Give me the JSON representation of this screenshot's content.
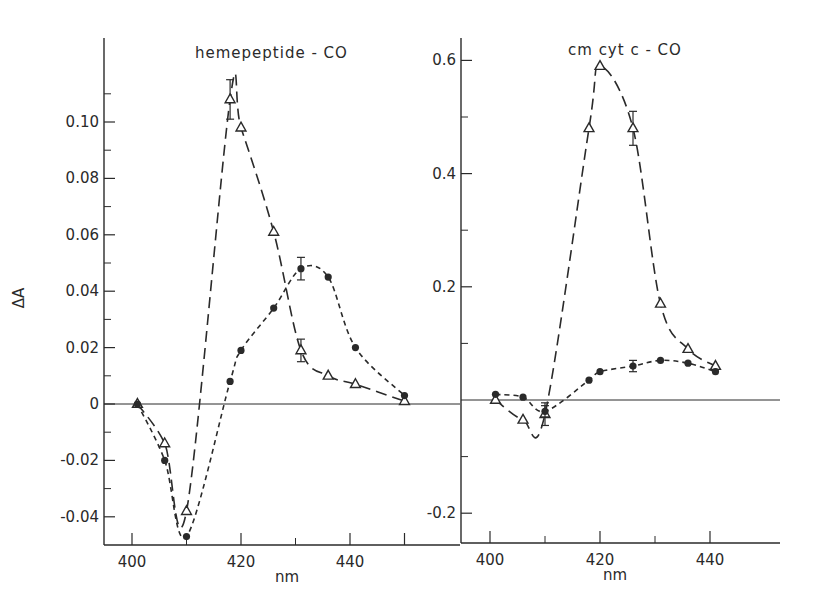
{
  "chart_data": [
    {
      "type": "line",
      "title": "hemepeptide - CO",
      "xlabel": "nm",
      "ylabel": "ΔA",
      "xlim": [
        395,
        452
      ],
      "ylim": [
        -0.05,
        0.125
      ],
      "xticks": [
        400,
        420,
        440
      ],
      "xtick_labels": [
        "400",
        "420",
        "440"
      ],
      "yticks": [
        -0.04,
        -0.02,
        0,
        0.02,
        0.04,
        0.06,
        0.08,
        0.1
      ],
      "ytick_labels": [
        "-0.04",
        "-0.02",
        "0",
        "0.02",
        "0.04",
        "0.06",
        "0.08",
        "0.10"
      ],
      "grid": false,
      "zero_line": true,
      "series": [
        {
          "name": "open triangles (long dash)",
          "marker": "triangle-open",
          "line": "long-dash",
          "x": [
            401,
            406,
            410,
            418,
            420,
            426,
            431,
            436,
            441,
            450
          ],
          "y": [
            0.0,
            -0.014,
            -0.038,
            0.108,
            0.098,
            0.061,
            0.019,
            0.01,
            0.007,
            0.001
          ],
          "error": [
            0,
            0,
            0,
            0.007,
            0,
            0,
            0.004,
            0,
            0,
            0
          ]
        },
        {
          "name": "filled circles (short dash)",
          "marker": "circle-filled",
          "line": "short-dash",
          "x": [
            401,
            406,
            410,
            418,
            420,
            426,
            431,
            436,
            441,
            450
          ],
          "y": [
            0.0,
            -0.02,
            -0.047,
            0.008,
            0.019,
            0.034,
            0.048,
            0.045,
            0.02,
            0.003
          ],
          "error": [
            0,
            0,
            0,
            0,
            0,
            0,
            0.004,
            0,
            0,
            0
          ]
        }
      ]
    },
    {
      "type": "line",
      "title": "cm cyt c - CO",
      "xlabel": "nm",
      "ylabel": "",
      "xlim": [
        395,
        452
      ],
      "ylim": [
        -0.24,
        0.64
      ],
      "xticks": [
        400,
        420,
        440
      ],
      "xtick_labels": [
        "400",
        "420",
        "440"
      ],
      "yticks": [
        -0.2,
        0.2,
        0.4,
        0.6
      ],
      "ytick_labels": [
        "-0.2",
        "0.2",
        "0.4",
        "0.6"
      ],
      "grid": false,
      "zero_line": true,
      "series": [
        {
          "name": "open triangles (long dash)",
          "marker": "triangle-open",
          "line": "long-dash",
          "x": [
            401,
            406,
            410,
            418,
            420,
            426,
            431,
            436,
            441
          ],
          "y": [
            0.0,
            -0.035,
            -0.025,
            0.48,
            0.59,
            0.48,
            0.17,
            0.09,
            0.06
          ],
          "error": [
            0,
            0,
            0.02,
            0,
            0,
            0.03,
            0,
            0,
            0
          ]
        },
        {
          "name": "filled circles (short dash)",
          "marker": "circle-filled",
          "line": "short-dash",
          "x": [
            401,
            406,
            410,
            418,
            420,
            426,
            431,
            436,
            441
          ],
          "y": [
            0.01,
            0.005,
            -0.02,
            0.035,
            0.05,
            0.06,
            0.07,
            0.065,
            0.05
          ],
          "error": [
            0,
            0,
            0.01,
            0,
            0,
            0.01,
            0,
            0,
            0
          ]
        }
      ]
    }
  ],
  "figure": {
    "left_panel": {
      "title": "hemepeptide - CO",
      "ylabel": "ΔA",
      "xlabel": "nm"
    },
    "right_panel": {
      "title": "cm cyt c - CO",
      "xlabel": "nm"
    },
    "ink_color": "#2a2a2a"
  }
}
